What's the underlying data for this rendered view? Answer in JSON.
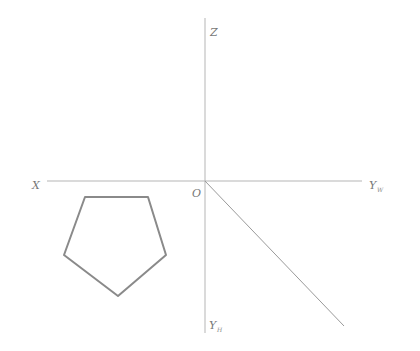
{
  "diagram": {
    "type": "orthographic-projection-axes",
    "colors": {
      "axis": "#b5b5b5",
      "shape": "#8a8a8a",
      "label": "#777777"
    },
    "labels": {
      "z": "Z",
      "x": "X",
      "origin": "O",
      "yw_main": "Y",
      "yw_sub": "W",
      "yh_main": "Y",
      "yh_sub": "H"
    },
    "shape": {
      "name": "pentagon",
      "points": "85,197 148,197 166,255 118,296 64,255"
    }
  }
}
